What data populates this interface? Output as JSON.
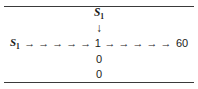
{
  "figure": {
    "background_color": "#ffffff",
    "rule_color": "#3a3a3a",
    "text_color": "#1a1a1a",
    "top_rule": "horizontal-rule",
    "bottom_rule": "horizontal-rule"
  },
  "center_column": {
    "top_label": "S",
    "top_label_subscript": "1",
    "down_arrow": "↓",
    "below_values": [
      "0",
      "0"
    ]
  },
  "main_row": {
    "start_label": "S",
    "start_label_subscript": "1",
    "middle_value": "1",
    "end_value": "60",
    "arrow_glyph": "→",
    "left_arrow_count": 5,
    "right_arrow_count": 5
  },
  "chart_data": {
    "type": "diagram",
    "title": "",
    "nodes": [
      {
        "id": "s1-top",
        "label": "S₁",
        "row": "top",
        "column": "center"
      },
      {
        "id": "s1-left",
        "label": "S₁",
        "row": "main",
        "column": "left"
      },
      {
        "id": "one",
        "label": "1",
        "row": "main",
        "column": "center"
      },
      {
        "id": "sixty",
        "label": "60",
        "row": "main",
        "column": "right"
      },
      {
        "id": "zero-1",
        "label": "0",
        "row": "below-1",
        "column": "center"
      },
      {
        "id": "zero-2",
        "label": "0",
        "row": "below-2",
        "column": "center"
      }
    ],
    "edges": [
      {
        "from": "s1-top",
        "to": "one",
        "glyph": "↓",
        "direction": "down",
        "count": 1
      },
      {
        "from": "s1-left",
        "to": "one",
        "glyph": "→",
        "direction": "right",
        "count": 5
      },
      {
        "from": "one",
        "to": "sixty",
        "glyph": "→",
        "direction": "right",
        "count": 5
      }
    ]
  }
}
